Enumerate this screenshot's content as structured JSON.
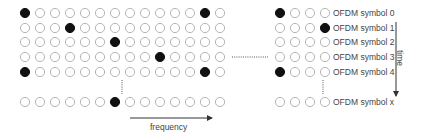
{
  "diagram": {
    "colors": {
      "filled": "#111111",
      "empty_stroke": "#b5b5b5",
      "arrow": "#333333",
      "text": "#444444"
    },
    "left_grid": {
      "columns": 14,
      "rows": [
        {
          "filled": [
            0,
            12
          ]
        },
        {
          "filled": [
            3
          ]
        },
        {
          "filled": [
            6
          ]
        },
        {
          "filled": [
            9
          ]
        },
        {
          "filled": [
            0,
            12
          ]
        },
        {
          "filled": [
            6
          ]
        }
      ]
    },
    "right_grid": {
      "columns": 4,
      "rows": [
        {
          "filled": [
            0
          ],
          "label": "OFDM symbol 0"
        },
        {
          "filled": [
            3
          ],
          "label": "OFDM symbol 1"
        },
        {
          "filled": [],
          "label": "OFDM symbol 2"
        },
        {
          "filled": [],
          "label": "OFDM symbol 3"
        },
        {
          "filled": [
            0
          ],
          "label": "OFDM symbol 4"
        },
        {
          "filled": [],
          "label": "OFDM symbol x"
        }
      ]
    },
    "axes": {
      "frequency_label": "frequency",
      "time_label": "time"
    }
  }
}
